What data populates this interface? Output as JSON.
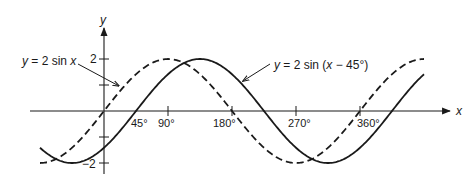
{
  "chart_data": {
    "type": "line",
    "title": "",
    "xlabel": "x",
    "ylabel": "y",
    "xlim": [
      -95,
      450
    ],
    "ylim": [
      -2.2,
      2.6
    ],
    "grid": false,
    "x_ticks": [
      {
        "value": 45,
        "label": "45°"
      },
      {
        "value": 90,
        "label": "90°"
      },
      {
        "value": 180,
        "label": "180°"
      },
      {
        "value": 270,
        "label": "270°"
      },
      {
        "value": 360,
        "label": "360°"
      }
    ],
    "y_ticks": [
      {
        "value": 2,
        "label": "2"
      },
      {
        "value": 1,
        "label": ""
      },
      {
        "value": -1,
        "label": ""
      },
      {
        "value": -2,
        "label": "−2"
      }
    ],
    "series": [
      {
        "name": "y = 2 sin x",
        "style": "dashed",
        "amplitude": 2,
        "phase_shift_deg": 0,
        "x_range": [
          -90,
          450
        ],
        "x": [
          -90,
          -45,
          0,
          45,
          90,
          135,
          180,
          225,
          270,
          315,
          360,
          405,
          450
        ],
        "values": [
          -2,
          -1.41,
          0,
          1.41,
          2,
          1.41,
          0,
          -1.41,
          -2,
          -1.41,
          0,
          1.41,
          2
        ]
      },
      {
        "name": "y = 2 sin (x − 45°)",
        "style": "solid",
        "amplitude": 2,
        "phase_shift_deg": 45,
        "x_range": [
          -90,
          450
        ],
        "x": [
          -90,
          -45,
          0,
          45,
          90,
          135,
          180,
          225,
          270,
          315,
          360,
          405,
          450
        ],
        "values": [
          -1.41,
          -2,
          -1.41,
          0,
          1.41,
          2,
          1.41,
          0,
          -1.41,
          -2,
          -1.41,
          0,
          1.41
        ]
      }
    ],
    "annotations": [
      {
        "text": "y = 2 sin x",
        "points_to": "series 0"
      },
      {
        "text": "y = 2 sin (x − 45°)",
        "points_to": "series 1"
      }
    ]
  },
  "labels": {
    "x_axis": "x",
    "y_axis": "y",
    "y_tick_pos": "2",
    "y_tick_neg": "−2",
    "tick_45": "45°",
    "tick_90": "90°",
    "tick_180": "180°",
    "tick_270": "270°",
    "tick_360": "360°",
    "annot_sinx_prefix": "y",
    "annot_sinx_rest": " = 2 sin ",
    "annot_sinx_var": "x",
    "annot_shift_prefix": "y",
    "annot_shift_rest": " = 2 sin (",
    "annot_shift_var": "x",
    "annot_shift_tail": " − 45°)"
  }
}
